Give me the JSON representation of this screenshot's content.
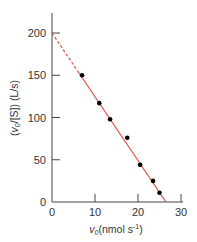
{
  "chart_data": {
    "type": "scatter",
    "title": "",
    "xlabel": "v0(nmol s-1)",
    "ylabel": "(v0/[S]) (L/s)",
    "xlim": [
      0,
      30
    ],
    "ylim": [
      0,
      220
    ],
    "xticks": [
      0,
      10,
      20,
      30
    ],
    "yticks": [
      0,
      50,
      100,
      150,
      200
    ],
    "grid": false,
    "legend": null,
    "series": [
      {
        "name": "data",
        "x": [
          7,
          11,
          13.5,
          17.5,
          20.5,
          23.5,
          25
        ],
        "y": [
          150,
          117,
          98,
          76,
          44,
          25,
          11
        ],
        "marker": "circle",
        "color": "#000000"
      }
    ],
    "fit_line": {
      "x0": 0,
      "y0": 200,
      "x_intercept": 26.5,
      "dashed_until_x": 6,
      "color": "#e05040"
    }
  },
  "axes": {
    "x_label_main": "v",
    "x_label_sub": "0",
    "x_label_rest": "(nmol s",
    "x_label_sup": "-1",
    "x_label_close": ")",
    "y_label_text": "(v0/[S]) (L/s)"
  }
}
